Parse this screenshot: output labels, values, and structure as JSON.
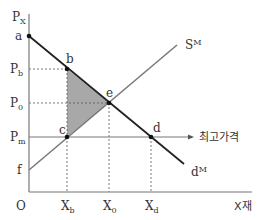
{
  "diagram": {
    "axes": {
      "y_label": "P",
      "y_label_sub": "X",
      "x_label": "X재",
      "origin": "O"
    },
    "price_levels": [
      {
        "label": "P",
        "sub": "b"
      },
      {
        "label": "P",
        "sub": "0"
      },
      {
        "label": "P",
        "sub": "m"
      }
    ],
    "y_intercepts": {
      "demand": "a",
      "supply": "f"
    },
    "quantity_levels": [
      {
        "label": "X",
        "sub": "b"
      },
      {
        "label": "X",
        "sub": "0"
      },
      {
        "label": "X",
        "sub": "d"
      }
    ],
    "points": {
      "b": "b",
      "e": "e",
      "c": "c",
      "d": "d"
    },
    "curves": {
      "supply": {
        "label": "S",
        "sup": "M"
      },
      "demand": {
        "label": "d",
        "sup": "M"
      }
    },
    "price_ceiling_label": "최고가격",
    "colors": {
      "axis": "#777777",
      "demand": "#222222",
      "supply": "#777777",
      "shade": "#a8a8a8",
      "guide": "#555555"
    }
  }
}
